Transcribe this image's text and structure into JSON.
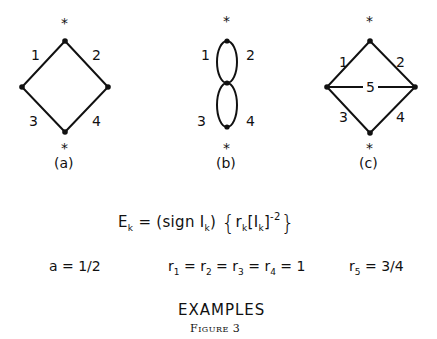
{
  "diagrams": [
    {
      "id": "a",
      "caption": "(a)",
      "edges": [
        {
          "label": "1",
          "from": "top",
          "to": "left"
        },
        {
          "label": "2",
          "from": "top",
          "to": "right"
        },
        {
          "label": "3",
          "from": "left",
          "to": "bottom"
        },
        {
          "label": "4",
          "from": "right",
          "to": "bottom"
        }
      ],
      "terminals": [
        "*",
        "*"
      ]
    },
    {
      "id": "b",
      "caption": "(b)",
      "edges": [
        {
          "label": "1",
          "from": "top",
          "to": "middle"
        },
        {
          "label": "2",
          "from": "top",
          "to": "middle"
        },
        {
          "label": "3",
          "from": "middle",
          "to": "bottom"
        },
        {
          "label": "4",
          "from": "middle",
          "to": "bottom"
        }
      ],
      "terminals": [
        "*",
        "*"
      ]
    },
    {
      "id": "c",
      "caption": "(c)",
      "edges": [
        {
          "label": "1",
          "from": "top",
          "to": "left"
        },
        {
          "label": "2",
          "from": "top",
          "to": "right"
        },
        {
          "label": "3",
          "from": "left",
          "to": "bottom"
        },
        {
          "label": "4",
          "from": "right",
          "to": "bottom"
        },
        {
          "label": "5",
          "from": "left",
          "to": "right"
        }
      ],
      "terminals": [
        "*",
        "*"
      ]
    }
  ],
  "formula": {
    "lhs": "E",
    "lhs_sub": "k",
    "eq": "=",
    "sign_part": "(sign I",
    "sign_sub": "k",
    "sign_close": ")",
    "r": "r",
    "r_sub": "k",
    "bracket_open": "[I",
    "bracket_sub": "k",
    "bracket_close": "]",
    "exponent": "-2",
    "brace_open": "{",
    "brace_close": "}"
  },
  "params": {
    "a": {
      "text": "a = 1/2"
    },
    "r_equal": {
      "r": "r",
      "subs": [
        "1",
        "2",
        "3",
        "4"
      ],
      "value": "1"
    },
    "r5": {
      "r": "r",
      "sub": "5",
      "value": "= 3/4"
    }
  },
  "title": "EXAMPLES",
  "figure_caption": "Figure 3"
}
